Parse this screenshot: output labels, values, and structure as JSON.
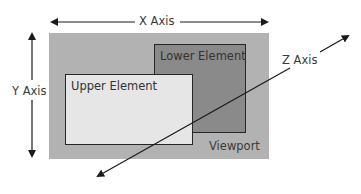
{
  "diagram": {
    "viewport": {
      "label": "Viewport",
      "color": "#b2b2b2"
    },
    "lower_element": {
      "label": "Lower Element",
      "color": "#8a8a8a"
    },
    "upper_element": {
      "label": "Upper Element",
      "color": "#e6e6e6"
    },
    "axes": {
      "x": {
        "label": "X Axis"
      },
      "y": {
        "label": "Y Axis"
      },
      "z": {
        "label": "Z Axis"
      }
    },
    "line_color": "#1a1a1a"
  }
}
